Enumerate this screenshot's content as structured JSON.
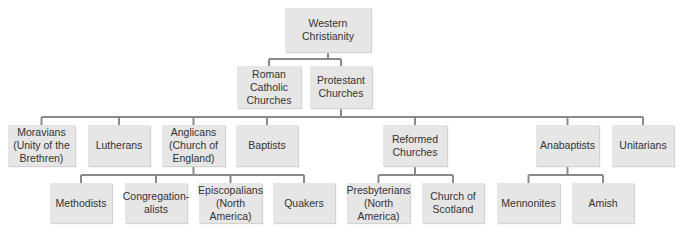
{
  "diagram": {
    "type": "tree",
    "title": "Western Christianity",
    "colors": {
      "box_fill": "#e6e6e6",
      "connector": "#8a8a8a",
      "text": "#333333"
    },
    "nodes": [
      {
        "id": "western",
        "label": "Western\nChristianity",
        "x": 285,
        "y": 8,
        "w": 86,
        "h": 44
      },
      {
        "id": "roman",
        "label": "Roman Catholic\nChurches",
        "x": 237,
        "y": 66,
        "w": 64,
        "h": 42
      },
      {
        "id": "protestant",
        "label": "Protestant\nChurches",
        "x": 310,
        "y": 66,
        "w": 62,
        "h": 42
      },
      {
        "id": "moravians",
        "label": "Moravians\n(Unity of the\nBrethren)",
        "x": 8,
        "y": 125,
        "w": 67,
        "h": 41
      },
      {
        "id": "lutherans",
        "label": "Lutherans",
        "x": 88,
        "y": 125,
        "w": 62,
        "h": 41
      },
      {
        "id": "anglicans",
        "label": "Anglicans\n(Church of\nEngland)",
        "x": 162,
        "y": 125,
        "w": 63,
        "h": 41
      },
      {
        "id": "baptists",
        "label": "Baptists",
        "x": 236,
        "y": 125,
        "w": 62,
        "h": 41
      },
      {
        "id": "reformed",
        "label": "Reformed\nChurches",
        "x": 383,
        "y": 125,
        "w": 64,
        "h": 41
      },
      {
        "id": "anabaptists",
        "label": "Anabaptists",
        "x": 536,
        "y": 125,
        "w": 63,
        "h": 41
      },
      {
        "id": "unitarians",
        "label": "Unitarians",
        "x": 612,
        "y": 125,
        "w": 62,
        "h": 41
      },
      {
        "id": "methodists",
        "label": "Methodists",
        "x": 50,
        "y": 183,
        "w": 62,
        "h": 40
      },
      {
        "id": "congregationalists",
        "label": "Congregation-\nalists",
        "x": 125,
        "y": 183,
        "w": 62,
        "h": 40
      },
      {
        "id": "episcopalians",
        "label": "Episcopalians\n(North America)",
        "x": 199,
        "y": 183,
        "w": 63,
        "h": 40
      },
      {
        "id": "quakers",
        "label": "Quakers",
        "x": 273,
        "y": 183,
        "w": 62,
        "h": 40
      },
      {
        "id": "presbyterians",
        "label": "Presbyterians\n(North America)",
        "x": 347,
        "y": 183,
        "w": 63,
        "h": 40
      },
      {
        "id": "church-of-scotland",
        "label": "Church of\nScotland",
        "x": 422,
        "y": 183,
        "w": 62,
        "h": 40
      },
      {
        "id": "mennonites",
        "label": "Mennonites",
        "x": 497,
        "y": 183,
        "w": 63,
        "h": 40
      },
      {
        "id": "amish",
        "label": "Amish",
        "x": 572,
        "y": 183,
        "w": 62,
        "h": 40
      }
    ],
    "edges": [
      {
        "from": "western",
        "to": [
          "roman",
          "protestant"
        ],
        "bar_y": 59
      },
      {
        "from": "protestant",
        "to": [
          "moravians",
          "lutherans",
          "anglicans",
          "baptists",
          "reformed",
          "anabaptists",
          "unitarians"
        ],
        "bar_y": 117
      },
      {
        "from": "anglicans",
        "to": [
          "methodists",
          "congregationalists",
          "episcopalians",
          "quakers"
        ],
        "bar_y": 175
      },
      {
        "from": "reformed",
        "to": [
          "presbyterians",
          "church-of-scotland"
        ],
        "bar_y": 175
      },
      {
        "from": "anabaptists",
        "to": [
          "mennonites",
          "amish"
        ],
        "bar_y": 175
      }
    ]
  }
}
